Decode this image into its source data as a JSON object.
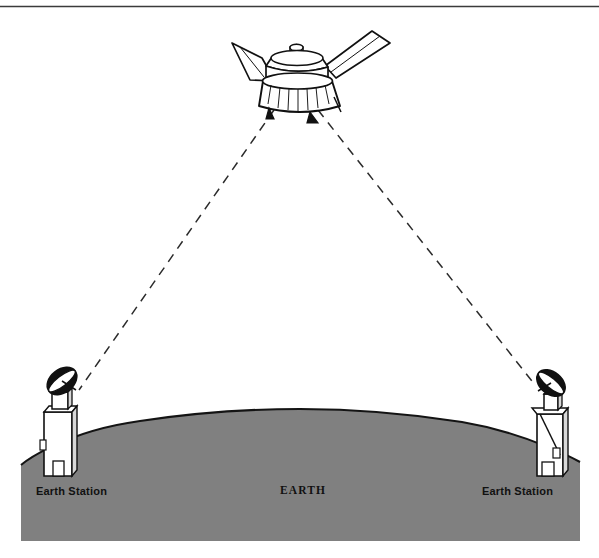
{
  "figure": {
    "top_rule": {
      "present": true,
      "color": "#3b3b3b"
    },
    "earth": {
      "label": "EARTH",
      "fill_color": "#808080",
      "outline_color": "#1a1a1a"
    },
    "satellite": {
      "name": "communications-satellite",
      "body_color": "#ffffff",
      "outline_color": "#111111",
      "solar_panels": 2
    },
    "stations": [
      {
        "id": "left",
        "label": "Earth Station",
        "dish_color": "#111111",
        "tower_color": "#ffffff"
      },
      {
        "id": "right",
        "label": "Earth Station",
        "dish_color": "#111111",
        "tower_color": "#ffffff"
      }
    ],
    "links": [
      {
        "id": "uplink-left",
        "style": "dashed",
        "color": "#2b2b2b",
        "from": "left-earth-station",
        "to": "satellite"
      },
      {
        "id": "downlink-right",
        "style": "dashed",
        "color": "#2b2b2b",
        "from": "satellite",
        "to": "right-earth-station"
      }
    ]
  }
}
